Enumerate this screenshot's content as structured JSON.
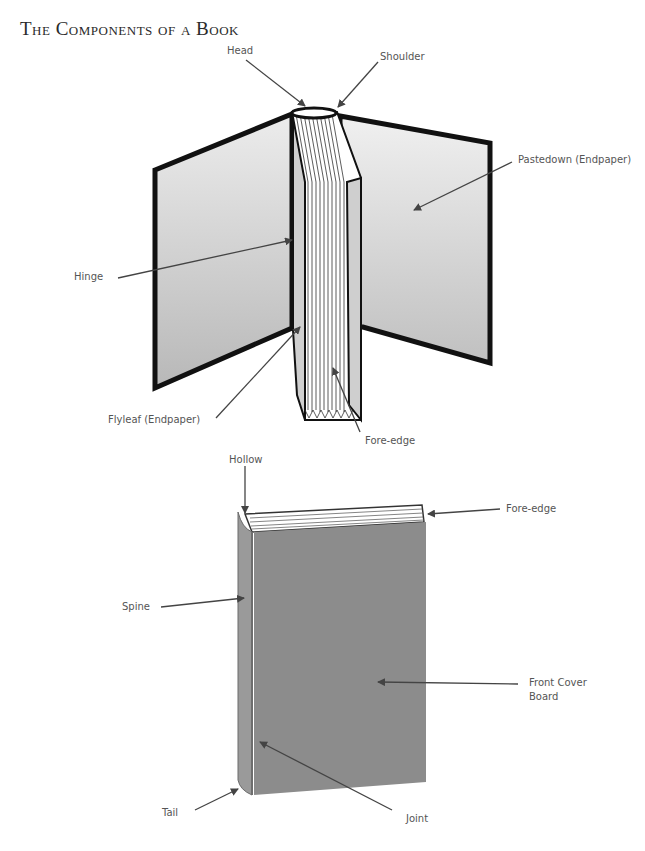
{
  "title": "The Components of a Book",
  "diagram_open_book": {
    "labels": {
      "head": "Head",
      "shoulder": "Shoulder",
      "pastedown": "Pastedown (Endpaper)",
      "hinge": "Hinge",
      "flyleaf": "Flyleaf (Endpaper)",
      "fore_edge": "Fore-edge"
    }
  },
  "diagram_closed_book": {
    "labels": {
      "hollow": "Hollow",
      "fore_edge": "Fore-edge",
      "spine": "Spine",
      "front_cover_board_line1": "Front Cover",
      "front_cover_board_line2": "Board",
      "tail": "Tail",
      "joint": "Joint"
    }
  },
  "colors": {
    "board_outline": "#111111",
    "endpaper_light": "#e6e6e6",
    "endpaper_dark": "#b9b9b9",
    "cover": "#8a8a8a",
    "spine": "#9a9a9a",
    "arrow": "#444444"
  }
}
